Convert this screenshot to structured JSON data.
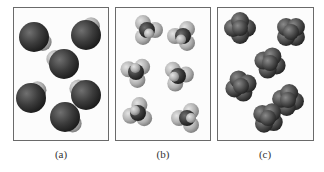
{
  "figure": {
    "panels": [
      {
        "label": "(a)",
        "description": "diatomic/bent molecules: one large dark sphere with one smaller light sphere",
        "frame": {
          "x": 13,
          "y": 7,
          "w": 96,
          "h": 134
        },
        "molecules": [
          {
            "cx": 34,
            "cy": 37,
            "angle": 30
          },
          {
            "cx": 86,
            "cy": 35,
            "angle": -60
          },
          {
            "cx": 64,
            "cy": 64,
            "angle": 210
          },
          {
            "cx": 31,
            "cy": 98,
            "angle": -50
          },
          {
            "cx": 86,
            "cy": 95,
            "angle": 220
          },
          {
            "cx": 65,
            "cy": 117,
            "angle": 40
          }
        ]
      },
      {
        "label": "(b)",
        "description": "tetrahedral-like molecules: small dark central atom with three light atoms",
        "frame": {
          "x": 115,
          "y": 7,
          "w": 96,
          "h": 134
        },
        "molecules": [
          {
            "cx": 147,
            "cy": 30,
            "angle": 0
          },
          {
            "cx": 183,
            "cy": 36,
            "angle": 60
          },
          {
            "cx": 136,
            "cy": 72,
            "angle": 200
          },
          {
            "cx": 178,
            "cy": 76,
            "angle": 110
          },
          {
            "cx": 138,
            "cy": 113,
            "angle": 160
          },
          {
            "cx": 187,
            "cy": 118,
            "angle": 300
          }
        ]
      },
      {
        "label": "(c)",
        "description": "dark clustered molecules: central atom with four bulging lobes",
        "frame": {
          "x": 217,
          "y": 7,
          "w": 97,
          "h": 134
        },
        "molecules": [
          {
            "cx": 240,
            "cy": 28,
            "angle": 0
          },
          {
            "cx": 291,
            "cy": 32,
            "angle": 45
          },
          {
            "cx": 270,
            "cy": 63,
            "angle": 20
          },
          {
            "cx": 241,
            "cy": 86,
            "angle": 70
          },
          {
            "cx": 288,
            "cy": 100,
            "angle": 10
          },
          {
            "cx": 268,
            "cy": 118,
            "angle": 35
          }
        ]
      }
    ],
    "colors": {
      "dark_atom": "#3a3a3a",
      "dark_atom_highlight": "#6a6a6a",
      "light_atom": "#b8b8b8",
      "light_atom_highlight": "#dcdcdc",
      "frame": "#6a6a6a",
      "label": "#333333"
    }
  }
}
